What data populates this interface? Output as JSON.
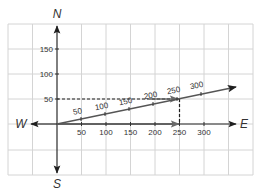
{
  "diagram": {
    "type": "vector-diagram",
    "directions": {
      "north": "N",
      "south": "S",
      "east": "E",
      "west": "W"
    },
    "x_axis_ticks": [
      "50",
      "100",
      "150",
      "200",
      "250",
      "300"
    ],
    "y_axis_ticks": [
      "50",
      "100",
      "150"
    ],
    "diagonal_vector_ticks": [
      "50",
      "100",
      "150",
      "200",
      "250",
      "300"
    ],
    "components": {
      "east_component": 250,
      "north_component": 50
    },
    "colors": {
      "grid": "#d4d4d4",
      "axis": "#2b2b2b",
      "vector": "#555555",
      "dashed_guide": "#1f1f1f"
    }
  }
}
